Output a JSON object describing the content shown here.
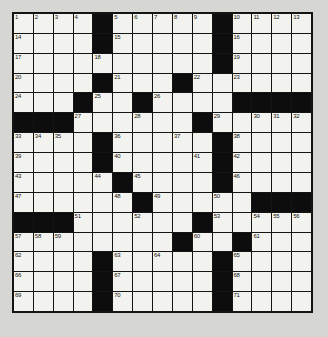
{
  "puzzle": {
    "type": "crossword-grid",
    "rows": 15,
    "columns": 15,
    "background_color": "#d6d6d2",
    "cell_fill_color": "#f2f2ee",
    "block_color": "#0d0d0d",
    "border_color": "#141414",
    "total_numbered_cells": 71,
    "black_square_count": 58,
    "layout": [
      "WWWWBWWWWWBWWWW",
      "WWWWBWWWWWBWWWW",
      "WWWWWWWWWWBWWWW",
      "WWWWBWWWBWWWWWW",
      "WWWBWWBWWWWBBBB",
      "BBBWWWWWWBWWWWW",
      "WWWWBWWWWWBWWWW",
      "WWWWBWWWWWBWWWW",
      "WWWWWBWWWWBWWWW",
      "WWWWWWBWWWWWBBB",
      "BBBWWWWWWBWWWWW",
      "WWWWWWWWBWWBWWW",
      "WWWWBWWWWWBWWWW",
      "WWWWBWWWWWBWWWW",
      "WWWWBWWWWWBWWWW"
    ],
    "numbers": {
      "r1": {
        "c1": "1",
        "c2": "2",
        "c3": "3",
        "c4": "4",
        "c6": "5",
        "c7": "6",
        "c8": "7",
        "c9": "8",
        "c10": "9",
        "c12": "10",
        "c13": "11",
        "c14": "12",
        "c15": "13"
      },
      "r2": {
        "c1": "14",
        "c6": "15",
        "c12": "16"
      },
      "r3": {
        "c1": "17",
        "c5": "18",
        "c12": "19"
      },
      "r4": {
        "c1": "20",
        "c6": "21",
        "c10": "22",
        "c12": "23"
      },
      "r5": {
        "c1": "24",
        "c5": "25",
        "c8": "26"
      },
      "r6": {
        "c4": "27",
        "c7": "28",
        "c11": "29",
        "c13": "30",
        "c14": "31",
        "c15": "32"
      },
      "r7": {
        "c1": "33",
        "c2": "34",
        "c3": "35",
        "c6": "36",
        "c9": "37",
        "c12": "38"
      },
      "r8": {
        "c1": "39",
        "c6": "40",
        "c10": "41",
        "c12": "42"
      },
      "r9": {
        "c1": "43",
        "c5": "44",
        "c7": "45",
        "c12": "46"
      },
      "r10": {
        "c1": "47",
        "c6": "48",
        "c8": "49",
        "c11": "50"
      },
      "r11": {
        "c4": "51",
        "c7": "52",
        "c11": "53",
        "c13": "54",
        "c14": "55",
        "c15": "56"
      },
      "r12": {
        "c1": "57",
        "c2": "58",
        "c3": "59",
        "c10": "60",
        "c13": "61"
      },
      "r13": {
        "c1": "62",
        "c6": "63",
        "c8": "64",
        "c12": "65"
      },
      "r14": {
        "c1": "66",
        "c6": "67",
        "c12": "68"
      },
      "r15": {
        "c1": "69",
        "c6": "70",
        "c12": "71"
      }
    }
  }
}
